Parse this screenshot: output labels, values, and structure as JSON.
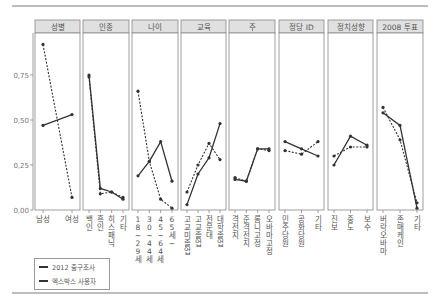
{
  "chart_data": {
    "type": "line",
    "title": "",
    "xlabel": "",
    "ylabel": "",
    "ylim": [
      0,
      1.0
    ],
    "yticks": [
      "0.00",
      "0.25",
      "0.50",
      "0.75"
    ],
    "ytick_labels_display": [
      "0,00",
      "0,25",
      "0,50",
      "0,75"
    ],
    "grid": false,
    "legend_position": "bottom-left",
    "legend": [
      "2012 출구조사",
      "엑스박스 사용자"
    ],
    "series_styles": {
      "2012 출구조사": "solid",
      "엑스박스 사용자": "dashed"
    },
    "panels": [
      {
        "title": "성별",
        "categories": [
          "남성",
          "여성"
        ],
        "series": [
          {
            "name": "2012 출구조사",
            "values": [
              0.47,
              0.53
            ]
          },
          {
            "name": "엑스박스 사용자",
            "values": [
              0.92,
              0.07
            ]
          }
        ]
      },
      {
        "title": "인종",
        "categories": [
          "백인",
          "흑인",
          "히스패닉",
          "기타"
        ],
        "series": [
          {
            "name": "2012 출구조사",
            "values": [
              0.75,
              0.12,
              0.1,
              0.06
            ]
          },
          {
            "name": "엑스박스 사용자",
            "values": [
              0.74,
              0.09,
              0.1,
              0.07
            ]
          }
        ]
      },
      {
        "title": "나이",
        "categories": [
          "18~29세",
          "30~44세",
          "45~64세",
          "65세~"
        ],
        "series": [
          {
            "name": "2012 출구조사",
            "values": [
              0.19,
              0.27,
              0.38,
              0.16
            ]
          },
          {
            "name": "엑스박스 사용자",
            "values": [
              0.66,
              0.27,
              0.06,
              0.01
            ]
          }
        ]
      },
      {
        "title": "교육",
        "categories": [
          "고교미졸업",
          "고교졸업",
          "전문대",
          "대학졸업"
        ],
        "series": [
          {
            "name": "2012 출구조사",
            "values": [
              0.03,
              0.2,
              0.29,
              0.48
            ]
          },
          {
            "name": "엑스박스 사용자",
            "values": [
              0.1,
              0.25,
              0.37,
              0.28
            ]
          }
        ]
      },
      {
        "title": "주",
        "categories": [
          "격전지",
          "준격전지",
          "롬니고정",
          "오바마고정"
        ],
        "series": [
          {
            "name": "2012 출구조사",
            "values": [
              0.17,
              0.16,
              0.34,
              0.34
            ]
          },
          {
            "name": "엑스박스 사용자",
            "values": [
              0.18,
              0.16,
              0.34,
              0.33
            ]
          }
        ]
      },
      {
        "title": "정당 ID",
        "categories": [
          "민주당원",
          "공화당원",
          "기타"
        ],
        "series": [
          {
            "name": "2012 출구조사",
            "values": [
              0.38,
              0.34,
              0.3
            ]
          },
          {
            "name": "엑스박스 사용자",
            "values": [
              0.33,
              0.31,
              0.38
            ]
          }
        ]
      },
      {
        "title": "정치성향",
        "categories": [
          "진보",
          "중도",
          "보수"
        ],
        "series": [
          {
            "name": "2012 출구조사",
            "values": [
              0.25,
              0.41,
              0.36
            ]
          },
          {
            "name": "엑스박스 사용자",
            "values": [
              0.3,
              0.35,
              0.35
            ]
          }
        ]
      },
      {
        "title": "2008 투표",
        "categories": [
          "버락 오바마",
          "존 매케인",
          "기타"
        ],
        "series": [
          {
            "name": "2012 출구조사",
            "values": [
              0.54,
              0.47,
              0.01
            ]
          },
          {
            "name": "엑스박스 사용자",
            "values": [
              0.57,
              0.39,
              0.04
            ]
          }
        ]
      }
    ]
  },
  "legend": {
    "solid_label": "2012 출구조사",
    "dashed_label": "엑스박스 사용자"
  },
  "colors": {
    "line": "#333333",
    "strip_bg": "#e0e0e0",
    "panel_border": "#888888",
    "rule": "#bdbdbd"
  }
}
